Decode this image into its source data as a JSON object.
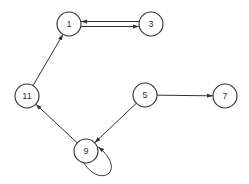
{
  "diagram": {
    "type": "directed-graph",
    "nodes": [
      {
        "id": "1",
        "label": "1"
      },
      {
        "id": "3",
        "label": "3"
      },
      {
        "id": "11",
        "label": "11"
      },
      {
        "id": "5",
        "label": "5"
      },
      {
        "id": "7",
        "label": "7"
      },
      {
        "id": "9",
        "label": "9"
      }
    ],
    "edges": [
      {
        "from": "1",
        "to": "3"
      },
      {
        "from": "3",
        "to": "1"
      },
      {
        "from": "11",
        "to": "1"
      },
      {
        "from": "5",
        "to": "7"
      },
      {
        "from": "5",
        "to": "9"
      },
      {
        "from": "9",
        "to": "11"
      },
      {
        "from": "9",
        "to": "9"
      }
    ],
    "colors": {
      "stroke": "#333333",
      "background": "#ffffff"
    }
  }
}
